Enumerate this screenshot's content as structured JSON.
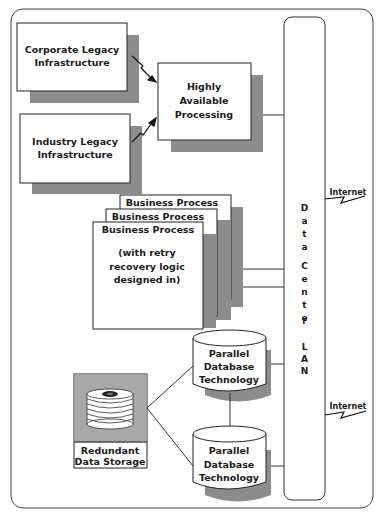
{
  "diagram": {
    "type": "architecture",
    "nodes": {
      "corporate_legacy": {
        "line1": "Corporate Legacy",
        "line2": "Infrastructure"
      },
      "industry_legacy": {
        "line1": "Industry Legacy",
        "line2": "Infrastructure"
      },
      "high_availability": {
        "line1": "Highly",
        "line2": "Available",
        "line3": "Processing"
      },
      "business_process": {
        "stack_titles": [
          "Business Process",
          "Business Process",
          "Business Process"
        ],
        "detail_line1": "(with retry",
        "detail_line2": "recovery logic",
        "detail_line3": "designed in)"
      },
      "database_1": {
        "line1": "Parallel",
        "line2": "Database",
        "line3": "Technology"
      },
      "database_2": {
        "line1": "Parallel",
        "line2": "Database",
        "line3": "Technology"
      },
      "storage": {
        "line1": "Redundant",
        "line2": "Data Storage"
      },
      "lan": {
        "letters": [
          "D",
          "a",
          "t",
          "a",
          "",
          "C",
          "e",
          "n",
          "t",
          "e",
          "r",
          "",
          "L",
          "A",
          "N"
        ],
        "label": "Data Center LAN"
      }
    },
    "external": {
      "internet_1": "Internet",
      "internet_2": "Internet"
    },
    "colors": {
      "shadow": "#8c8c8c",
      "stroke": "#333333",
      "fill": "#ffffff",
      "storage_bg": "#a8a8a8"
    }
  }
}
